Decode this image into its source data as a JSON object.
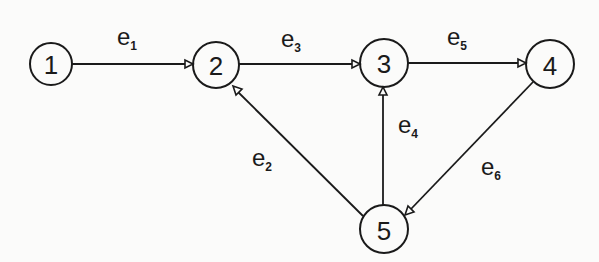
{
  "diagram": {
    "type": "directed-graph",
    "nodes": [
      {
        "id": "1",
        "label": "1",
        "cx": 51,
        "cy": 64,
        "r": 21
      },
      {
        "id": "2",
        "label": "2",
        "cx": 216,
        "cy": 65,
        "r": 23
      },
      {
        "id": "3",
        "label": "3",
        "cx": 384,
        "cy": 63,
        "r": 24
      },
      {
        "id": "4",
        "label": "4",
        "cx": 550,
        "cy": 64,
        "r": 24
      },
      {
        "id": "5",
        "label": "5",
        "cx": 384,
        "cy": 229,
        "r": 24
      }
    ],
    "edges": [
      {
        "id": "e1",
        "base": "e",
        "sub": "1",
        "from": "1",
        "to": "2"
      },
      {
        "id": "e2",
        "base": "e",
        "sub": "2",
        "from": "5",
        "to": "2"
      },
      {
        "id": "e3",
        "base": "e",
        "sub": "3",
        "from": "2",
        "to": "3"
      },
      {
        "id": "e4",
        "base": "e",
        "sub": "4",
        "from": "5",
        "to": "3"
      },
      {
        "id": "e5",
        "base": "e",
        "sub": "5",
        "from": "3",
        "to": "4"
      },
      {
        "id": "e6",
        "base": "e",
        "sub": "6",
        "from": "4",
        "to": "5"
      }
    ]
  }
}
